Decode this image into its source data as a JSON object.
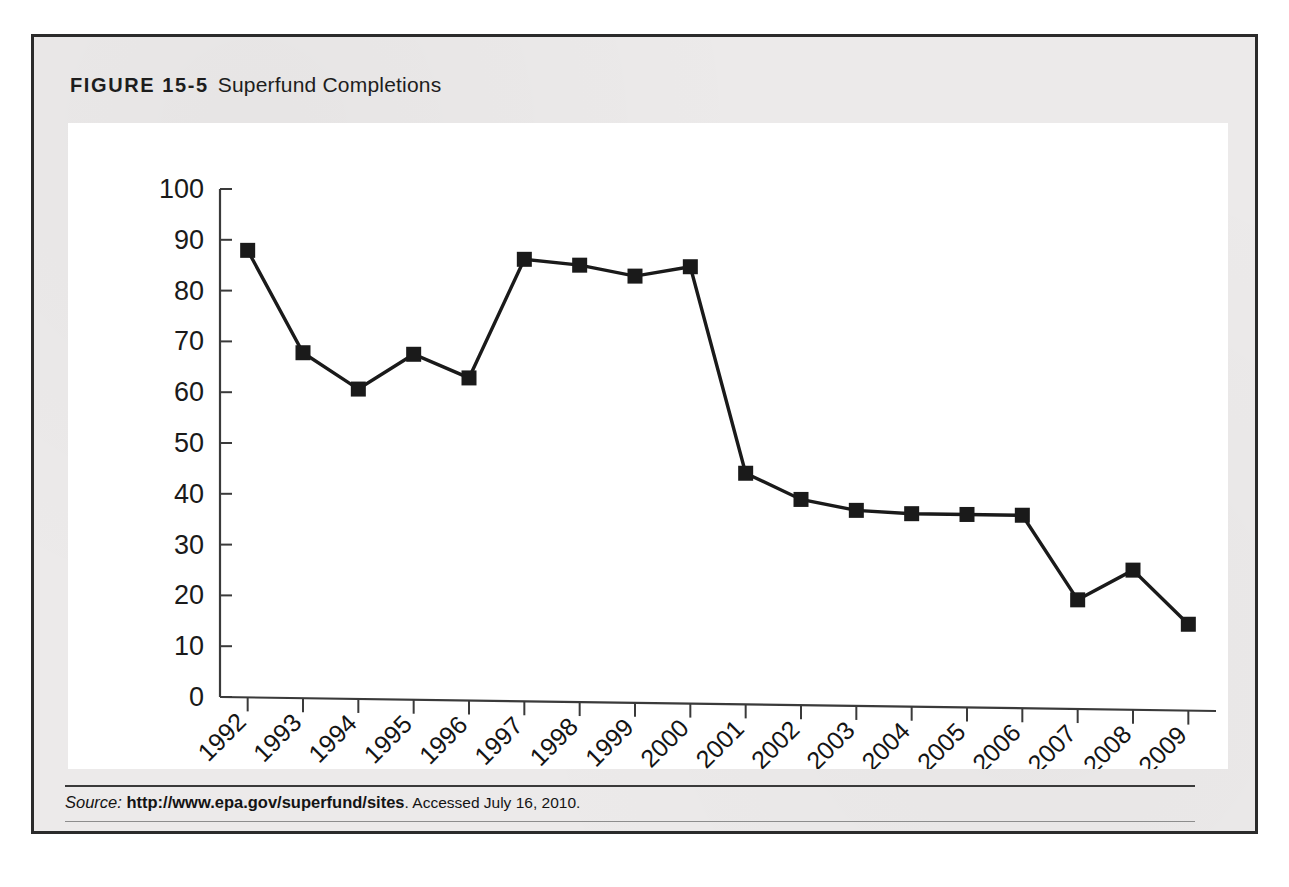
{
  "figure": {
    "label": "FIGURE 15-5",
    "caption": "Superfund Completions"
  },
  "source": {
    "prefix": "Source:",
    "url": "http://www.epa.gov/superfund/sites",
    "accessed": ". Accessed July 16, 2010."
  },
  "colors": {
    "line": "#1a1a1a",
    "marker": "#1a1a1a",
    "axis": "#3a3a3a",
    "panel_background": "#ffffff",
    "figure_background": "#eceaea",
    "border": "#2b2b2b",
    "text": "#141414"
  },
  "chart_data": {
    "type": "line",
    "title": "Superfund Completions",
    "xlabel": "",
    "ylabel": "",
    "ylim": [
      0,
      100
    ],
    "yticks": [
      0,
      10,
      20,
      30,
      40,
      50,
      60,
      70,
      80,
      90,
      100
    ],
    "ytick_labels": [
      "0",
      "10",
      "20",
      "30",
      "40",
      "50",
      "60",
      "70",
      "80",
      "90",
      "100"
    ],
    "grid": false,
    "legend": false,
    "legend_position": "none",
    "marker": "square",
    "categories": [
      "1992",
      "1993",
      "1994",
      "1995",
      "1996",
      "1997",
      "1998",
      "1999",
      "2000",
      "2001",
      "2002",
      "2003",
      "2004",
      "2005",
      "2006",
      "2007",
      "2008",
      "2009"
    ],
    "values": [
      88,
      68,
      61,
      68,
      63.5,
      87,
      86,
      84,
      86,
      45.5,
      40.5,
      38.5,
      38,
      38,
      38,
      21.5,
      27.5,
      17
    ],
    "series": [
      {
        "name": "Superfund construction completions",
        "values": [
          88,
          68,
          61,
          68,
          63.5,
          87,
          86,
          84,
          86,
          45.5,
          40.5,
          38.5,
          38,
          38,
          38,
          21.5,
          27.5,
          17
        ]
      }
    ]
  }
}
